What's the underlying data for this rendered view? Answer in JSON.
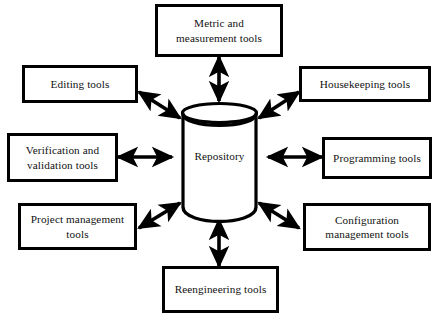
{
  "diagram": {
    "type": "hub-and-spoke",
    "title": "",
    "background_color": "#ffffff",
    "stroke_color": "#000000",
    "text_color": "#111111",
    "center": {
      "shape": "cylinder-database",
      "label": "Repository"
    },
    "connector": {
      "style": "double-headed-arrow",
      "count": 8
    },
    "nodes": [
      {
        "id": "metric",
        "label": "Metric and\nmeasurement tools",
        "position": "top"
      },
      {
        "id": "housekeeping",
        "label": "Housekeeping tools",
        "position": "top-right"
      },
      {
        "id": "programming",
        "label": "Programming tools",
        "position": "right"
      },
      {
        "id": "configuration",
        "label": "Configuration\nmanagement tools",
        "position": "bottom-right"
      },
      {
        "id": "reengineering",
        "label": "Reengineering tools",
        "position": "bottom"
      },
      {
        "id": "project",
        "label": "Project management\ntools",
        "position": "bottom-left"
      },
      {
        "id": "verification",
        "label": "Verification and\nvalidation tools",
        "position": "left"
      },
      {
        "id": "editing",
        "label": "Editing tools",
        "position": "top-left"
      }
    ]
  }
}
